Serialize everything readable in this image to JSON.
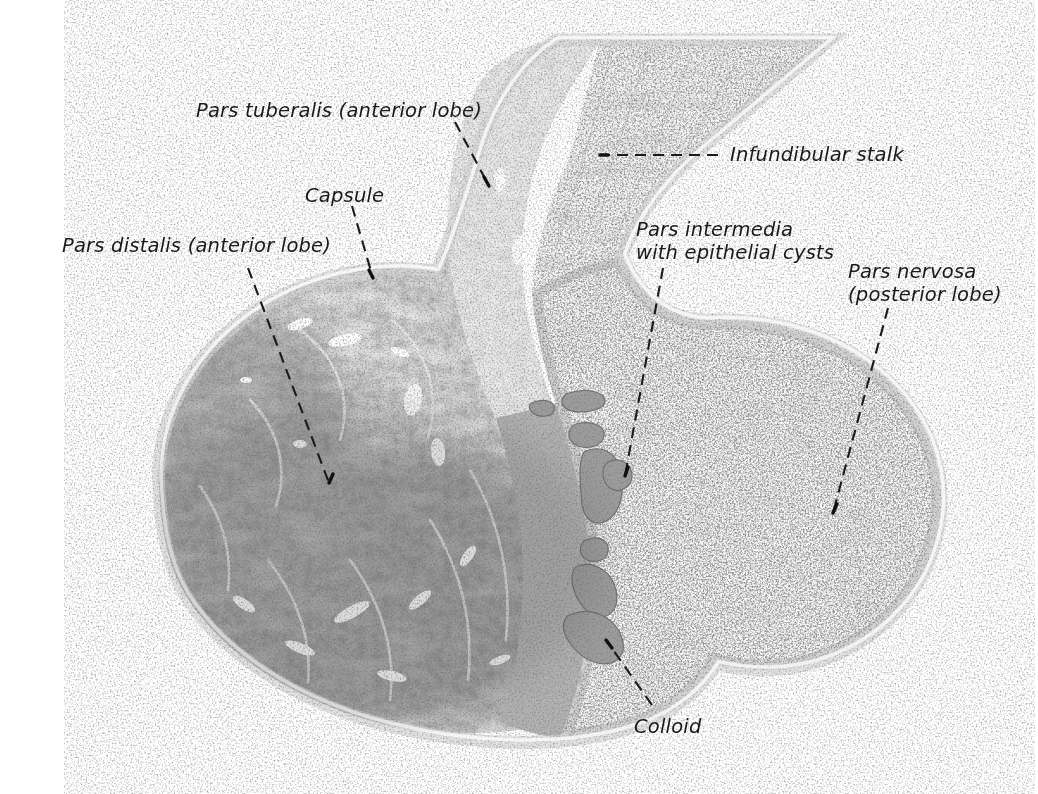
{
  "figure": {
    "kind": "histology-micrograph",
    "background_color": "#ffffff",
    "ink_color": "#1a1a1a"
  },
  "labels": [
    {
      "id": "pars-tuberalis",
      "text": "Pars tuberalis (anterior lobe)",
      "lines": [
        "Pars tuberalis (anterior lobe)"
      ],
      "x": 196,
      "y": 99,
      "align": "left",
      "leader": {
        "style": "dashed",
        "from": [
          455,
          122
        ],
        "to": [
          489,
          186
        ]
      }
    },
    {
      "id": "infundibular-stalk",
      "text": "Infundibular stalk",
      "lines": [
        "Infundibular stalk"
      ],
      "x": 730,
      "y": 143,
      "align": "left",
      "leader": {
        "style": "dashed",
        "from": [
          718,
          155
        ],
        "to": [
          600,
          155
        ]
      }
    },
    {
      "id": "capsule",
      "text": "Capsule",
      "lines": [
        "Capsule"
      ],
      "x": 305,
      "y": 184,
      "align": "left",
      "leader": {
        "style": "dashed",
        "from": [
          352,
          206
        ],
        "to": [
          373,
          278
        ]
      }
    },
    {
      "id": "pars-intermedia",
      "text": "Pars intermedia with epithelial cysts",
      "lines": [
        "Pars intermedia",
        "with epithelial cysts"
      ],
      "x": 636,
      "y": 218,
      "align": "left",
      "leader": {
        "style": "dashed",
        "from": [
          663,
          268
        ],
        "to": [
          625,
          476
        ]
      }
    },
    {
      "id": "pars-distalis",
      "text": "Pars distalis (anterior lobe)",
      "lines": [
        "Pars distalis (anterior lobe)"
      ],
      "x": 62,
      "y": 234,
      "align": "left",
      "leader": {
        "style": "dashed",
        "from": [
          248,
          268
        ],
        "to": [
          329,
          483
        ]
      }
    },
    {
      "id": "pars-nervosa",
      "text": "Pars nervosa (posterior lobe)",
      "lines": [
        "Pars nervosa",
        "(posterior lobe)"
      ],
      "x": 848,
      "y": 260,
      "align": "left",
      "leader": {
        "style": "dashed",
        "from": [
          888,
          308
        ],
        "to": [
          833,
          513
        ]
      }
    },
    {
      "id": "colloid",
      "text": "Colloid",
      "lines": [
        "Colloid"
      ],
      "x": 634,
      "y": 715,
      "align": "left",
      "leader": {
        "style": "dashed",
        "from": [
          652,
          705
        ],
        "to": [
          606,
          640
        ]
      }
    }
  ],
  "regions": [
    {
      "id": "pars-distalis",
      "name": "Pars distalis (anterior lobe)",
      "tone": "dark",
      "fill": "#9a9a9a"
    },
    {
      "id": "pars-tuberalis",
      "name": "Pars tuberalis (anterior lobe)",
      "tone": "medium",
      "fill": "#c9c9c9"
    },
    {
      "id": "infundibular-stalk",
      "name": "Infundibular stalk",
      "tone": "light",
      "fill": "#e4e4e4"
    },
    {
      "id": "pars-intermedia",
      "name": "Pars intermedia with epithelial cysts",
      "tone": "medium-dark",
      "fill": "#a8a8a8"
    },
    {
      "id": "pars-nervosa",
      "name": "Pars nervosa (posterior lobe)",
      "tone": "very-light",
      "fill": "#f2f2f2"
    },
    {
      "id": "capsule",
      "name": "Capsule",
      "tone": "rim",
      "fill": "#8c8c8c"
    },
    {
      "id": "colloid",
      "name": "Colloid",
      "tone": "flat-gray",
      "fill": "#9d9d9d"
    }
  ]
}
